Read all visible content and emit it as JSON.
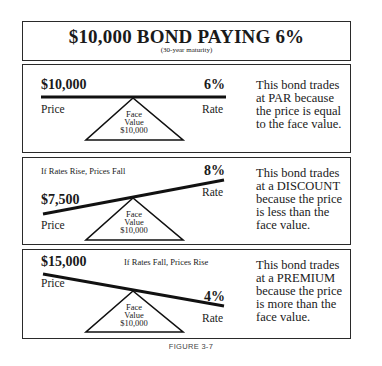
{
  "header": {
    "title": "$10,000 BOND PAYING 6%",
    "subtitle": "(30-year maturity)"
  },
  "panels": [
    {
      "scenario": "",
      "price_value": "$10,000",
      "price_label": "Price",
      "rate_value": "6%",
      "rate_label": "Rate",
      "fulcrum": {
        "line1": "Face",
        "line2": "Value",
        "line3": "$10,000"
      },
      "description": [
        "This bond trades",
        "at PAR because",
        "the price is equal",
        "to the face value."
      ]
    },
    {
      "scenario": "If Rates Rise, Prices Fall",
      "price_value": "$7,500",
      "price_label": "Price",
      "rate_value": "8%",
      "rate_label": "Rate",
      "fulcrum": {
        "line1": "Face",
        "line2": "Value",
        "line3": "$10,000"
      },
      "description": [
        "This bond trades",
        "at a DISCOUNT",
        "because the price",
        "is less than the",
        "face value."
      ]
    },
    {
      "scenario": "If Rates Fall, Prices Rise",
      "price_value": "$15,000",
      "price_label": "Price",
      "rate_value": "4%",
      "rate_label": "Rate",
      "fulcrum": {
        "line1": "Face",
        "line2": "Value",
        "line3": "$10,000"
      },
      "description": [
        "This bond trades",
        "at a PREMIUM",
        "because the price",
        "is more than the",
        "face value."
      ]
    }
  ],
  "caption": "FIGURE 3-7"
}
